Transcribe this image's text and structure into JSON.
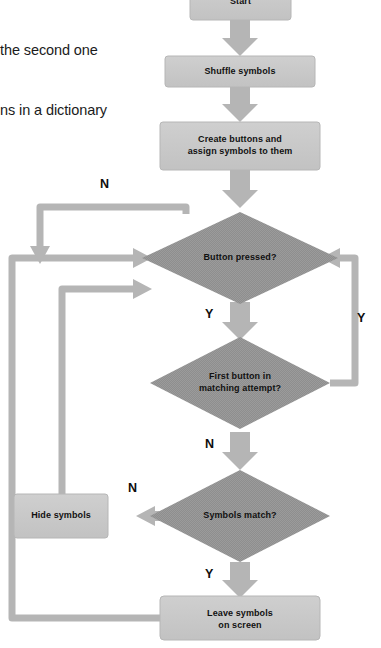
{
  "page": {
    "background": "#ffffff",
    "caption_lines": [
      "the second one",
      "ns in a dictionary"
    ]
  },
  "palette": {
    "box_fill": "#c7c7c7",
    "box_stroke": "#b3b3b3",
    "diamond_fill": "#8e8e8e",
    "arrow_fill": "#b5b5b5",
    "connector_fill": "#b5b5b5",
    "text": "#111111"
  },
  "flowchart": {
    "title": "memory game flowchart",
    "nodes": [
      {
        "id": "start",
        "type": "process",
        "label": "Start"
      },
      {
        "id": "shuffle",
        "type": "process",
        "label": "Shuffle symbols"
      },
      {
        "id": "create",
        "type": "process",
        "label": "Create buttons and\nassign symbols to them"
      },
      {
        "id": "button",
        "type": "decision",
        "label": "Button pressed?"
      },
      {
        "id": "first",
        "type": "decision",
        "label": "First button in\nmatching attempt?"
      },
      {
        "id": "match",
        "type": "decision",
        "label": "Symbols match?"
      },
      {
        "id": "hide",
        "type": "process",
        "label": "Hide symbols"
      },
      {
        "id": "leave",
        "type": "process",
        "label": "Leave symbols\non screen"
      }
    ],
    "edges": [
      {
        "id": "e-start-shuffle",
        "from": "start",
        "to": "shuffle",
        "label": ""
      },
      {
        "id": "e-shuffle-create",
        "from": "shuffle",
        "to": "create",
        "label": ""
      },
      {
        "id": "e-create-button",
        "from": "create",
        "to": "button",
        "label": ""
      },
      {
        "id": "e-button-no",
        "from": "button",
        "to": "button",
        "label": "N"
      },
      {
        "id": "e-button-yes",
        "from": "button",
        "to": "first",
        "label": "Y"
      },
      {
        "id": "e-first-yes",
        "from": "first",
        "to": "button",
        "label": "Y"
      },
      {
        "id": "e-first-no",
        "from": "first",
        "to": "match",
        "label": "N"
      },
      {
        "id": "e-match-no",
        "from": "match",
        "to": "hide",
        "label": "N"
      },
      {
        "id": "e-match-yes",
        "from": "match",
        "to": "leave",
        "label": "Y"
      },
      {
        "id": "e-hide-button",
        "from": "hide",
        "to": "button",
        "label": ""
      },
      {
        "id": "e-leave-button",
        "from": "leave",
        "to": "button",
        "label": ""
      }
    ],
    "branch_labels": [
      {
        "id": "n-button-loop",
        "text": "N"
      },
      {
        "id": "y-button-first",
        "text": "Y"
      },
      {
        "id": "y-first-loop",
        "text": "Y"
      },
      {
        "id": "n-first-match",
        "text": "N"
      },
      {
        "id": "n-match-hide",
        "text": "N"
      },
      {
        "id": "y-match-leave",
        "text": "Y"
      }
    ]
  }
}
